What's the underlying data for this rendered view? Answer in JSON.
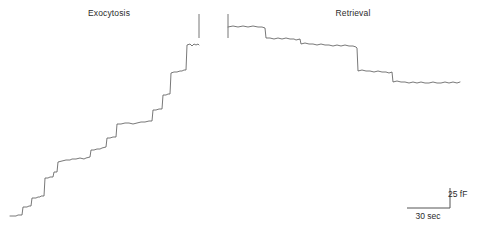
{
  "figure": {
    "background_color": "#ffffff",
    "trace_color": "#555555",
    "text_color": "#2b2b2b"
  },
  "panels": {
    "exocytosis": {
      "title": "Exocytosis"
    },
    "retrieval": {
      "title": "Retrieval"
    }
  },
  "scale_bar": {
    "vertical_label": "25 fF",
    "horizontal_label": "30 sec",
    "corner_x": 450,
    "corner_y": 188,
    "vertical_length_px": 20,
    "horizontal_length_px": 43
  },
  "chart_data": {
    "type": "line",
    "xlabel": "Time",
    "ylabel": "Membrane capacitance (Cm)",
    "grid": false,
    "legend": false,
    "axes_shown": false,
    "units": {
      "y": "fF",
      "x": "sec"
    },
    "scale_bar": {
      "y_value": 25,
      "y_unit": "fF",
      "x_value": 30,
      "x_unit": "sec"
    },
    "annotations": [
      {
        "text": "Exocytosis",
        "x_px": 109,
        "y_px": 13
      },
      {
        "text": "Retrieval",
        "x_px": 353,
        "y_px": 13
      },
      {
        "text": "25 fF",
        "x_px": 458,
        "y_px": 194
      },
      {
        "text": "30 sec",
        "x_px": 428,
        "y_px": 216
      }
    ],
    "markers": [
      {
        "name": "exocytosis-end-tick",
        "type": "vertical-tick",
        "x_px": 199,
        "y1_px": 14,
        "y2_px": 38
      },
      {
        "name": "retrieval-start-tick",
        "type": "vertical-tick",
        "x_px": 228,
        "y1_px": 14,
        "y2_px": 38
      }
    ],
    "series": [
      {
        "name": "Exocytosis",
        "direction": "upward-staircase",
        "description": "Stepwise increases in membrane capacitance from discrete vesicle fusion events",
        "points_px": [
          [
            10,
            216
          ],
          [
            16,
            216
          ],
          [
            18,
            215
          ],
          [
            22,
            215
          ],
          [
            23,
            207
          ],
          [
            27,
            207
          ],
          [
            29,
            206
          ],
          [
            31,
            206
          ],
          [
            32,
            198
          ],
          [
            36,
            198
          ],
          [
            38,
            197
          ],
          [
            40,
            197
          ],
          [
            41,
            196
          ],
          [
            44,
            196
          ],
          [
            45,
            178
          ],
          [
            48,
            178
          ],
          [
            50,
            177
          ],
          [
            53,
            177
          ],
          [
            54,
            172
          ],
          [
            57,
            172
          ],
          [
            58,
            162
          ],
          [
            62,
            161
          ],
          [
            66,
            160
          ],
          [
            70,
            160
          ],
          [
            72,
            159
          ],
          [
            76,
            159
          ],
          [
            80,
            158
          ],
          [
            84,
            159
          ],
          [
            86,
            158
          ],
          [
            90,
            157
          ],
          [
            91,
            150
          ],
          [
            94,
            150
          ],
          [
            97,
            149
          ],
          [
            100,
            149
          ],
          [
            102,
            148
          ],
          [
            106,
            147
          ],
          [
            107,
            138
          ],
          [
            110,
            138
          ],
          [
            113,
            137
          ],
          [
            116,
            137
          ],
          [
            117,
            124
          ],
          [
            121,
            124
          ],
          [
            125,
            123
          ],
          [
            129,
            123
          ],
          [
            133,
            124
          ],
          [
            137,
            123
          ],
          [
            141,
            122
          ],
          [
            145,
            122
          ],
          [
            149,
            121
          ],
          [
            152,
            121
          ],
          [
            153,
            110
          ],
          [
            156,
            110
          ],
          [
            159,
            109
          ],
          [
            162,
            109
          ],
          [
            163,
            95
          ],
          [
            166,
            95
          ],
          [
            168,
            94
          ],
          [
            170,
            94
          ],
          [
            171,
            73
          ],
          [
            174,
            72
          ],
          [
            177,
            72
          ],
          [
            180,
            71
          ],
          [
            182,
            71
          ],
          [
            184,
            70
          ],
          [
            186,
            70
          ],
          [
            187,
            45
          ],
          [
            190,
            44
          ],
          [
            192,
            46
          ],
          [
            194,
            44
          ],
          [
            196,
            45
          ],
          [
            198,
            44
          ],
          [
            199,
            45
          ]
        ]
      },
      {
        "name": "Retrieval",
        "direction": "downward-staircase",
        "description": "Stepwise decreases in membrane capacitance from discrete vesicle fission/retrieval events",
        "points_px": [
          [
            228,
            27
          ],
          [
            233,
            26
          ],
          [
            238,
            27
          ],
          [
            243,
            26
          ],
          [
            248,
            27
          ],
          [
            253,
            26
          ],
          [
            258,
            27
          ],
          [
            262,
            27
          ],
          [
            265,
            28
          ],
          [
            266,
            38
          ],
          [
            270,
            38
          ],
          [
            274,
            39
          ],
          [
            278,
            38
          ],
          [
            282,
            39
          ],
          [
            286,
            38
          ],
          [
            290,
            39
          ],
          [
            294,
            39
          ],
          [
            296,
            40
          ],
          [
            300,
            39
          ],
          [
            301,
            44
          ],
          [
            305,
            43
          ],
          [
            309,
            44
          ],
          [
            313,
            44
          ],
          [
            317,
            45
          ],
          [
            321,
            44
          ],
          [
            325,
            45
          ],
          [
            329,
            45
          ],
          [
            333,
            46
          ],
          [
            337,
            45
          ],
          [
            341,
            46
          ],
          [
            345,
            45
          ],
          [
            349,
            46
          ],
          [
            353,
            46
          ],
          [
            356,
            47
          ],
          [
            357,
            48
          ],
          [
            358,
            71
          ],
          [
            362,
            70
          ],
          [
            366,
            71
          ],
          [
            370,
            71
          ],
          [
            374,
            72
          ],
          [
            378,
            71
          ],
          [
            382,
            72
          ],
          [
            386,
            72
          ],
          [
            389,
            73
          ],
          [
            392,
            72
          ],
          [
            393,
            82
          ],
          [
            397,
            81
          ],
          [
            401,
            82
          ],
          [
            405,
            82
          ],
          [
            409,
            83
          ],
          [
            413,
            82
          ],
          [
            417,
            83
          ],
          [
            421,
            82
          ],
          [
            425,
            83
          ],
          [
            429,
            83
          ],
          [
            433,
            82
          ],
          [
            437,
            83
          ],
          [
            441,
            83
          ],
          [
            445,
            82
          ],
          [
            449,
            83
          ],
          [
            453,
            82
          ],
          [
            457,
            83
          ],
          [
            460,
            82
          ]
        ]
      }
    ]
  }
}
